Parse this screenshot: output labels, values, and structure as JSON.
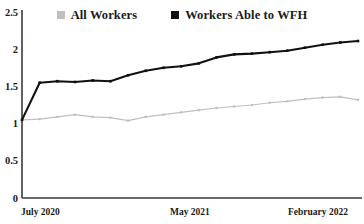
{
  "chart_data": {
    "type": "line",
    "title": "",
    "subtitle": "",
    "xlabel": "",
    "ylabel": "",
    "ylim": [
      0,
      2.5
    ],
    "yticks": [
      0,
      0.5,
      1,
      1.5,
      2,
      2.5
    ],
    "ytick_labels": [
      "0",
      "0.5",
      "1",
      "1.5",
      "2",
      "2.5"
    ],
    "xtick_labels": [
      "July 2020",
      "May 2021",
      "February 2022"
    ],
    "xtick_positions": [
      0,
      10,
      18
    ],
    "grid": false,
    "legend_position": "top-center",
    "x": [
      "July 2020",
      "August 2020",
      "September 2020",
      "October 2020",
      "November 2020",
      "December 2020",
      "January 2021",
      "February 2021",
      "March 2021",
      "April 2021",
      "May 2021",
      "June 2021",
      "July 2021",
      "August 2021",
      "September 2021",
      "October 2021",
      "November 2021",
      "December 2021",
      "January 2022",
      "February 2022"
    ],
    "series": [
      {
        "name": "All Workers",
        "color": "#bfbfbf",
        "marker": "square",
        "values": [
          1.05,
          1.06,
          1.09,
          1.12,
          1.09,
          1.08,
          1.04,
          1.09,
          1.12,
          1.15,
          1.18,
          1.21,
          1.23,
          1.25,
          1.28,
          1.3,
          1.33,
          1.35,
          1.36,
          1.32
        ]
      },
      {
        "name": "Workers Able to WFH",
        "color": "#111111",
        "marker": "square",
        "values": [
          1.05,
          1.55,
          1.57,
          1.56,
          1.58,
          1.57,
          1.65,
          1.71,
          1.75,
          1.77,
          1.81,
          1.89,
          1.93,
          1.94,
          1.96,
          1.98,
          2.02,
          2.06,
          2.09,
          2.11
        ]
      }
    ]
  },
  "legend": {
    "entries": [
      {
        "label": "All Workers",
        "color": "#bfbfbf"
      },
      {
        "label": "Workers Able to WFH",
        "color": "#111111"
      }
    ]
  },
  "axes": {
    "y_labels": [
      "2.5",
      "2",
      "1.5",
      "1",
      "0.5",
      "0"
    ],
    "x_labels": [
      "July 2020",
      "May 2021",
      "February 2022"
    ],
    "axis_color": "#3a3a3a"
  }
}
